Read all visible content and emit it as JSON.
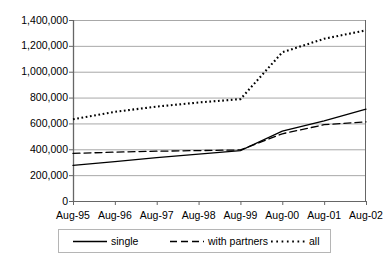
{
  "chart_data": {
    "type": "line",
    "title": "",
    "subtitle": "",
    "xlabel": "",
    "ylabel": "",
    "x": [
      "Aug-95",
      "Aug-96",
      "Aug-97",
      "Aug-98",
      "Aug-99",
      "Aug-00",
      "Aug-01",
      "Aug-02"
    ],
    "categories": [
      "Aug-95",
      "Aug-96",
      "Aug-97",
      "Aug-98",
      "Aug-99",
      "Aug-00",
      "Aug-01",
      "Aug-02"
    ],
    "ylim": [
      0,
      1400000
    ],
    "yticks": [
      0,
      200000,
      400000,
      600000,
      800000,
      1000000,
      1200000,
      1400000
    ],
    "ytick_labels": [
      "0",
      "200,000",
      "400,000",
      "600,000",
      "800,000",
      "1,000,000",
      "1,200,000",
      "1,400,000"
    ],
    "grid": true,
    "grid_axis": "y",
    "grid_color": "#a8a8a8",
    "axis_color": "#666666",
    "legend_position": "bottom",
    "series": [
      {
        "name": "single",
        "style": "solid",
        "color": "#000000",
        "values": [
          275000,
          305000,
          335000,
          362000,
          390000,
          540000,
          620000,
          710000
        ]
      },
      {
        "name": "with partners",
        "style": "dashed",
        "color": "#000000",
        "values": [
          368000,
          378000,
          385000,
          390000,
          395000,
          520000,
          590000,
          612000
        ]
      },
      {
        "name": "all",
        "style": "dotted",
        "color": "#000000",
        "values": [
          632000,
          690000,
          730000,
          762000,
          788000,
          1150000,
          1255000,
          1320000
        ]
      }
    ]
  },
  "legend": {
    "entries": [
      {
        "label": "single",
        "style": "solid"
      },
      {
        "label": "with partners",
        "style": "dashed"
      },
      {
        "label": "all",
        "style": "dotted"
      }
    ]
  }
}
